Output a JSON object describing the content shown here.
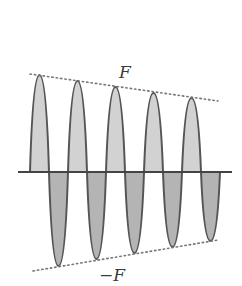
{
  "diagram": {
    "type": "damped-oscillation",
    "labels": {
      "upper_envelope": "F",
      "lower_envelope": "−F"
    },
    "colors": {
      "background": "#ffffff",
      "outline": "#555555",
      "upper_fill": "#d2d2d2",
      "lower_fill": "#b4b4b4",
      "axis": "#444444",
      "envelope": "#777777",
      "text": "#3a3a3a"
    },
    "axis": {
      "y": 172,
      "x_start": 18,
      "x_end": 232
    },
    "wave": {
      "x_start": 30,
      "half_period": 19,
      "peaks": [
        {
          "x": 39.5,
          "y": 75
        },
        {
          "x": 77.5,
          "y": 81
        },
        {
          "x": 115.5,
          "y": 87
        },
        {
          "x": 153.5,
          "y": 93
        },
        {
          "x": 191.5,
          "y": 98
        }
      ],
      "troughs": [
        {
          "x": 58.5,
          "y": 266
        },
        {
          "x": 96.5,
          "y": 259
        },
        {
          "x": 134.5,
          "y": 253
        },
        {
          "x": 172.5,
          "y": 247
        },
        {
          "x": 210.5,
          "y": 241
        }
      ]
    },
    "envelopes": {
      "upper": {
        "x1": 30,
        "y1": 74,
        "x2": 218,
        "y2": 101
      },
      "lower": {
        "x1": 33,
        "y1": 271,
        "x2": 218,
        "y2": 240
      }
    },
    "label_positions": {
      "upper": {
        "x": 125,
        "y": 78
      },
      "lower": {
        "x": 112,
        "y": 281
      }
    }
  }
}
